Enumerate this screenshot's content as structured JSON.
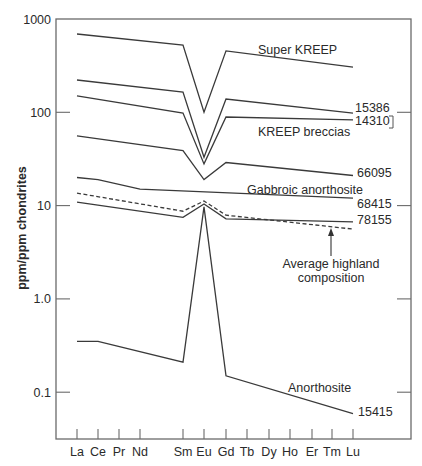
{
  "chart_data": {
    "type": "line",
    "title": "",
    "xlabel": "",
    "ylabel": "ppm/ppm chondrites",
    "yscale": "log",
    "ylim": [
      0.04,
      1000
    ],
    "yticks": [
      {
        "value": 1000,
        "label": "1000"
      },
      {
        "value": 100,
        "label": "100"
      },
      {
        "value": 10,
        "label": "10"
      },
      {
        "value": 1,
        "label": "1.0"
      },
      {
        "value": 0.1,
        "label": "0.1"
      }
    ],
    "categories": [
      "La",
      "Ce",
      "Pr",
      "Nd",
      "Sm",
      "Eu",
      "Gd",
      "Tb",
      "Dy",
      "Ho",
      "Er",
      "Tm",
      "Lu"
    ],
    "grid": false,
    "series": [
      {
        "name": "Super KREEP",
        "style": "solid",
        "points": {
          "La": 690,
          "Sm": 525,
          "Eu": 100,
          "Gd": 455,
          "Lu": 305
        }
      },
      {
        "name": "15386",
        "style": "solid",
        "points": {
          "La": 222,
          "Sm": 165,
          "Eu": 33,
          "Gd": 139,
          "Lu": 98
        }
      },
      {
        "name": "14310",
        "style": "solid",
        "points": {
          "La": 150,
          "Sm": 98,
          "Eu": 28,
          "Gd": 89,
          "Lu": 83
        }
      },
      {
        "name": "66095",
        "style": "solid",
        "points": {
          "La": 56,
          "Sm": 39,
          "Eu": 19,
          "Gd": 29,
          "Lu": 21
        }
      },
      {
        "name": "68415",
        "style": "solid",
        "points": {
          "La": 20,
          "Ce": 19,
          "Nd": 15,
          "Lu": 12
        }
      },
      {
        "name": "Average highland composition",
        "style": "dashed",
        "points": {
          "La": 13.6,
          "Sm": 8.7,
          "Eu": 11.2,
          "Gd": 7.9,
          "Lu": 5.6
        }
      },
      {
        "name": "78155",
        "style": "solid",
        "points": {
          "La": 10.9,
          "Sm": 7.5,
          "Eu": 10.4,
          "Gd": 7.2,
          "Lu": 6.7
        }
      },
      {
        "name": "15415",
        "style": "solid",
        "points": {
          "La": 0.35,
          "Ce": 0.35,
          "Sm": 0.21,
          "Eu": 9.7,
          "Gd": 0.15,
          "Lu": 0.059
        }
      }
    ],
    "annotations": [
      {
        "text": "Super KREEP",
        "x": 258,
        "y": 54
      },
      {
        "text": "15386",
        "x": 355,
        "y": 112
      },
      {
        "text": "14310",
        "x": 355,
        "y": 125
      },
      {
        "text": "KREEP breccias",
        "x": 258,
        "y": 136
      },
      {
        "text": "66095",
        "x": 357,
        "y": 177
      },
      {
        "text": "Gabbroic anorthosite",
        "x": 247,
        "y": 194
      },
      {
        "text": "68415",
        "x": 357,
        "y": 208
      },
      {
        "text": "78155",
        "x": 357,
        "y": 224
      },
      {
        "text": "Average highland",
        "x": 327,
        "y": 264
      },
      {
        "text": "composition",
        "x": 327,
        "y": 278
      },
      {
        "text": "Anorthosite",
        "x": 288,
        "y": 392
      },
      {
        "text": "15415",
        "x": 358,
        "y": 416
      }
    ]
  },
  "labels": {
    "y_axis_title": "ppm/ppm chondrites",
    "super_kreep": "Super KREEP",
    "s15386": "15386",
    "s14310": "14310",
    "kreep_breccias": "KREEP breccias",
    "s66095": "66095",
    "gabbroic": "Gabbroic anorthosite",
    "s68415": "68415",
    "s78155": "78155",
    "avg_highland_1": "Average highland",
    "avg_highland_2": "composition",
    "anorthosite": "Anorthosite",
    "s15415": "15415"
  }
}
